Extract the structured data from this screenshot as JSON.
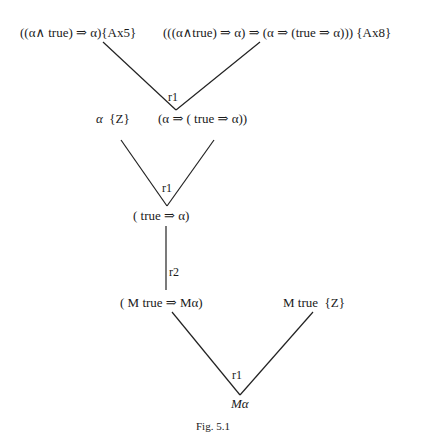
{
  "figure": {
    "caption": "Fig. 5.1"
  },
  "nodes": {
    "ax5": {
      "formula": "((α∧ true) ⇒ α)",
      "annotation": "{Ax5}"
    },
    "ax8": {
      "formula": "(((α∧true) ⇒ α) ⇒ (α ⇒ (true ⇒ α)))",
      "annotation": "{Ax8}"
    },
    "alpha_z": {
      "formula": "α",
      "annotation": "{Z}"
    },
    "alpha_impl": {
      "formula": "(α ⇒ ( true ⇒ α))"
    },
    "true_impl": {
      "formula": "( true ⇒ α)"
    },
    "m_impl": {
      "formula": "( M true ⇒ Mα)"
    },
    "m_true_z": {
      "formula": "M true",
      "annotation": "{Z}"
    },
    "m_alpha": {
      "formula": "Mα"
    }
  },
  "rules": {
    "r1_top": "r1",
    "r1_mid": "r1",
    "r2": "r2",
    "r1_bottom": "r1"
  },
  "edges": [
    {
      "from": "ax5",
      "to": "alpha_impl",
      "rule": "r1"
    },
    {
      "from": "ax8",
      "to": "alpha_impl",
      "rule": "r1"
    },
    {
      "from": "alpha_z",
      "to": "true_impl",
      "rule": "r1"
    },
    {
      "from": "alpha_impl",
      "to": "true_impl",
      "rule": "r1"
    },
    {
      "from": "true_impl",
      "to": "m_impl",
      "rule": "r2"
    },
    {
      "from": "m_impl",
      "to": "m_alpha",
      "rule": "r1"
    },
    {
      "from": "m_true_z",
      "to": "m_alpha",
      "rule": "r1"
    }
  ]
}
